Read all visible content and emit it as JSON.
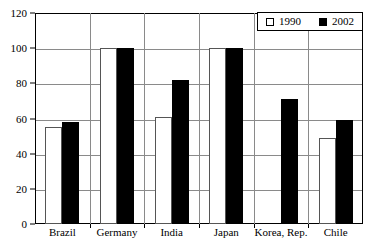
{
  "chart_data": {
    "type": "bar",
    "title": "",
    "subtitle": "",
    "xlabel": "",
    "ylabel": "",
    "ylim": [
      0,
      120
    ],
    "ytick_values": [
      0,
      20,
      40,
      60,
      80,
      100,
      120
    ],
    "ytick_labels": [
      "0",
      "20",
      "40",
      "60",
      "80",
      "100",
      "120"
    ],
    "grid": true,
    "gridlines_at": [
      20,
      40,
      60,
      80,
      100
    ],
    "legend_position": "top-right",
    "categories": [
      "Brazil",
      "Germany",
      "India",
      "Japan",
      "Korea, Rep.",
      "Chile"
    ],
    "series": [
      {
        "name": "1990",
        "style": "hollow",
        "color": "#ffffff",
        "edge_color": "#555555",
        "values": [
          55,
          100,
          61,
          100,
          0,
          49
        ]
      },
      {
        "name": "2002",
        "style": "filled",
        "color": "#000000",
        "edge_color": "#000000",
        "values": [
          58,
          100,
          82,
          100,
          71,
          59
        ]
      }
    ]
  },
  "legend": {
    "items": [
      {
        "label": "1990",
        "swatch": "hollow-square-icon"
      },
      {
        "label": "2002",
        "swatch": "filled-square-icon"
      }
    ]
  },
  "colors": {
    "axis": "#000000",
    "gridline": "#8a8a8a",
    "background": "#ffffff",
    "series_1990": "#ffffff",
    "series_2002": "#000000"
  }
}
